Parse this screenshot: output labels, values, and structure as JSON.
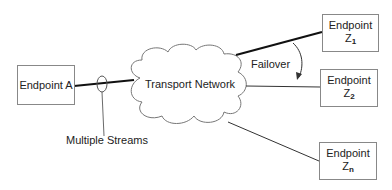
{
  "diagram": {
    "cloud": {
      "label": "Transport Network"
    },
    "source": {
      "label": "Endpoint A"
    },
    "streams_label": "Multiple Streams",
    "failover_label": "Failover",
    "endpoints": [
      {
        "label": "Endpoint",
        "name": "Z",
        "sub": "1"
      },
      {
        "label": "Endpoint",
        "name": "Z",
        "sub": "2"
      },
      {
        "label": "Endpoint",
        "name": "Z",
        "sub": "n"
      }
    ]
  }
}
